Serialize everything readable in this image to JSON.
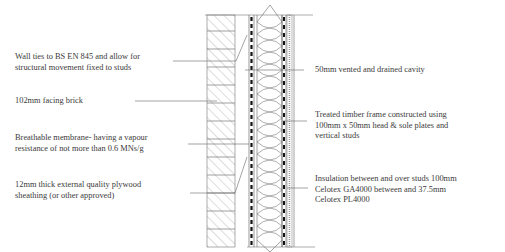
{
  "diagram": {
    "type": "wall construction section",
    "labels_left": [
      {
        "id": "wall-ties",
        "text": "Wall ties to BS EN 845 and allow for\nstructural movement fixed to studs"
      },
      {
        "id": "facing-brick",
        "text": "102mm facing brick"
      },
      {
        "id": "breathable-membrane",
        "text": "Breathable membrane- having a vapour\nresistance of not more than 0.6 MNs/g"
      },
      {
        "id": "plywood-sheathing",
        "text": "12mm thick external quality plywood\nsheathing (or other approved)"
      }
    ],
    "labels_right": [
      {
        "id": "cavity",
        "text": "50mm vented and drained cavity"
      },
      {
        "id": "timber-frame",
        "text": "Treated timber frame constructed using\n100mm x 50mm head & sole plates and\nvertical studs"
      },
      {
        "id": "insulation",
        "text": "Insulation between and over studs 100mm\nCelotex GA4000 between and 37.5mm\nCelotex PL4000"
      }
    ],
    "colors": {
      "line": "#555555",
      "text": "#3a3a3a",
      "background": "#ffffff"
    }
  }
}
